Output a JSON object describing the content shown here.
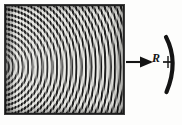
{
  "figure": {
    "kind": "optics-interference-photograph",
    "caption_text": "",
    "background_color": "#fdfdfc",
    "ink_color": "#141414"
  },
  "photograph": {
    "name": "moire-interference-fringes",
    "description": "Square photographic plate showing circular interference fringes overlaid with straight fringes",
    "frame": {
      "x": 5,
      "y": 5,
      "width": 119,
      "height": 109
    },
    "fringe_color_dark": "#121212",
    "fringe_color_light": "#efefea",
    "straight_fringe_count": 74,
    "circular_fringe_count": 30,
    "circular_center": {
      "x": -6,
      "y": 62
    }
  },
  "annotations": {
    "radius_arrow": {
      "label": "R",
      "name": "radius-of-curvature-arrow",
      "direction": "right",
      "start_x": 126,
      "end_x": 170,
      "y": 62
    },
    "mirror_arc": {
      "name": "concave-mirror-arc",
      "bulge": "right",
      "top_y": 37,
      "bottom_y": 92,
      "stroke_width": 4,
      "color": "#141414"
    }
  }
}
